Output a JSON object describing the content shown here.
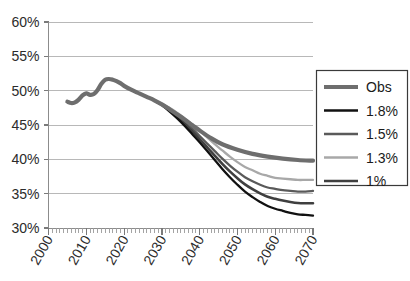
{
  "chart_data": {
    "type": "line",
    "title": "",
    "subtitle": "",
    "xlabel": "",
    "ylabel": "",
    "xlim": [
      2000,
      2070
    ],
    "ylim": [
      30,
      60
    ],
    "y_tick_labels": [
      "30%",
      "35%",
      "40%",
      "45%",
      "50%",
      "55%",
      "60%"
    ],
    "y_tick_values": [
      30,
      35,
      40,
      45,
      50,
      55,
      60
    ],
    "x_tick_labels": [
      "2000",
      "2010",
      "2020",
      "2030",
      "2040",
      "2050",
      "2060",
      "2070"
    ],
    "x_tick_values": [
      2000,
      2010,
      2020,
      2030,
      2040,
      2050,
      2060,
      2070
    ],
    "grid": true,
    "legend_position": "right",
    "y_axis_unit": "%",
    "x_minor_tick_interval": 1,
    "series": [
      {
        "name": "Obs",
        "color": "#6e6e6e",
        "width": 4.2,
        "x": [
          2005,
          2006,
          2007,
          2008,
          2009,
          2010,
          2011,
          2012,
          2013,
          2014,
          2015,
          2016,
          2017,
          2018,
          2019,
          2020,
          2022,
          2024,
          2026,
          2028,
          2030,
          2032,
          2035,
          2038,
          2040,
          2043,
          2046,
          2050,
          2054,
          2058,
          2062,
          2066,
          2070
        ],
        "values": [
          48.4,
          48.2,
          48.3,
          48.7,
          49.3,
          49.6,
          49.4,
          49.5,
          50.1,
          51.0,
          51.6,
          51.7,
          51.6,
          51.4,
          51.1,
          50.7,
          50.1,
          49.6,
          49.1,
          48.6,
          48.0,
          47.3,
          46.2,
          45.0,
          44.2,
          43.1,
          42.2,
          41.4,
          40.8,
          40.4,
          40.1,
          39.9,
          39.8
        ]
      },
      {
        "name": "1.8%",
        "color": "#111111",
        "width": 2.3,
        "x": [
          2028,
          2030,
          2032,
          2034,
          2036,
          2038,
          2040,
          2042,
          2044,
          2046,
          2048,
          2050,
          2052,
          2054,
          2056,
          2058,
          2060,
          2062,
          2064,
          2066,
          2068,
          2070
        ],
        "values": [
          48.6,
          47.9,
          47.0,
          46.0,
          44.9,
          43.7,
          42.5,
          41.2,
          39.9,
          38.6,
          37.4,
          36.3,
          35.3,
          34.5,
          33.8,
          33.2,
          32.8,
          32.5,
          32.2,
          32.0,
          31.9,
          31.8
        ]
      },
      {
        "name": "1.5%",
        "color": "#5a5a5a",
        "width": 2.3,
        "x": [
          2028,
          2030,
          2032,
          2034,
          2036,
          2038,
          2040,
          2042,
          2044,
          2046,
          2048,
          2050,
          2052,
          2054,
          2056,
          2058,
          2060,
          2062,
          2064,
          2066,
          2068,
          2070
        ],
        "values": [
          48.6,
          48.0,
          47.3,
          46.4,
          45.5,
          44.5,
          43.4,
          42.3,
          41.2,
          40.1,
          39.1,
          38.2,
          37.4,
          36.8,
          36.3,
          35.9,
          35.7,
          35.5,
          35.4,
          35.3,
          35.3,
          35.4
        ]
      },
      {
        "name": "1.3%",
        "color": "#a8a8a8",
        "width": 2.3,
        "x": [
          2028,
          2030,
          2032,
          2034,
          2036,
          2038,
          2040,
          2042,
          2044,
          2046,
          2048,
          2050,
          2052,
          2054,
          2056,
          2058,
          2060,
          2062,
          2064,
          2066,
          2068,
          2070
        ],
        "values": [
          48.6,
          48.1,
          47.5,
          46.8,
          46.0,
          45.1,
          44.2,
          43.2,
          42.2,
          41.3,
          40.4,
          39.6,
          38.9,
          38.4,
          37.9,
          37.6,
          37.3,
          37.2,
          37.1,
          37.0,
          37.0,
          37.0
        ]
      },
      {
        "name": "1%",
        "color": "#3f3f3f",
        "width": 2.6,
        "x": [
          2028,
          2030,
          2032,
          2034,
          2036,
          2038,
          2040,
          2042,
          2044,
          2046,
          2048,
          2050,
          2052,
          2054,
          2056,
          2058,
          2060,
          2062,
          2064,
          2066,
          2068,
          2070
        ],
        "values": [
          48.6,
          47.95,
          47.15,
          46.2,
          45.2,
          44.1,
          42.95,
          41.75,
          40.55,
          39.35,
          38.25,
          37.25,
          36.35,
          35.65,
          35.05,
          34.55,
          34.25,
          34.0,
          33.8,
          33.65,
          33.6,
          33.6
        ]
      }
    ]
  },
  "legend": {
    "entries": [
      {
        "label": "Obs"
      },
      {
        "label": "1.8%"
      },
      {
        "label": "1.5%"
      },
      {
        "label": "1.3%"
      },
      {
        "label": "1%"
      }
    ]
  }
}
